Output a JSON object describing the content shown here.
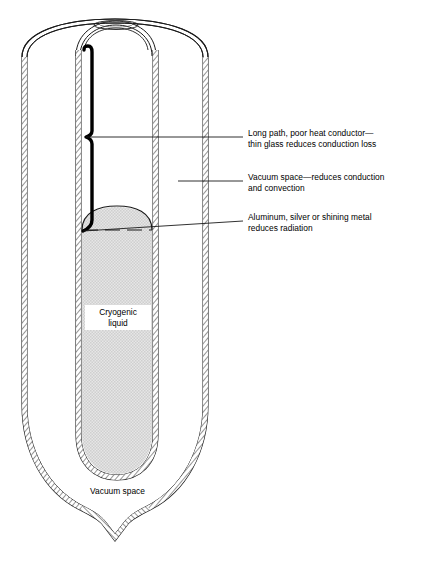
{
  "figure": {
    "colors": {
      "stroke": "#1a1a1a",
      "liquid_fill": "#dcdcdc",
      "wall_fill": "#f2f2f2",
      "background": "#ffffff",
      "thick_path": "#000000"
    }
  },
  "callouts": [
    {
      "id": "conduction-path",
      "text": "Long path, poor heat conductor—\nthin glass reduces conduction loss",
      "leader": {
        "x1": 80,
        "y1": 137,
        "x2": 243,
        "y2": 137
      }
    },
    {
      "id": "vacuum-space",
      "text": "Vacuum space—reduces conduction\nand convection",
      "leader": {
        "x1": 178,
        "y1": 181,
        "x2": 243,
        "y2": 181
      }
    },
    {
      "id": "silvered-surface",
      "text": "Aluminum, silver or shining metal\nreduces radiation",
      "leader": {
        "x1": 82,
        "y1": 230,
        "x2": 243,
        "y2": 221
      }
    }
  ],
  "inner_labels": [
    {
      "id": "cryogenic-liquid",
      "text": "Cryogenic\nliquid"
    },
    {
      "id": "vacuum-space-bottom",
      "text": "Vacuum space"
    }
  ]
}
